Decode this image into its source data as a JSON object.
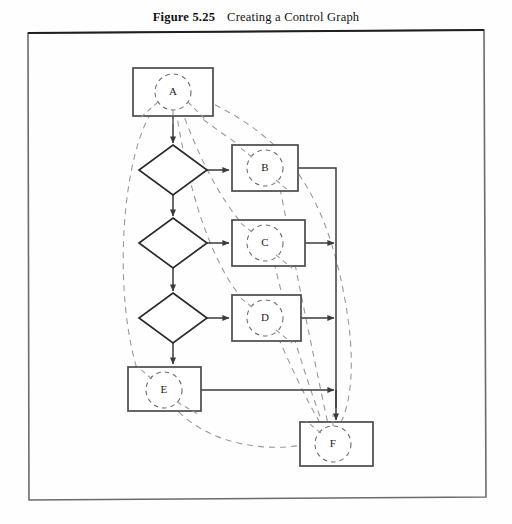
{
  "caption": {
    "figure_number": "Figure 5.25",
    "title": "Creating a Control Graph"
  },
  "colors": {
    "frame": "#6b6b6b",
    "solid_line": "#3a3a3a",
    "dashed_line": "#9a9a9a",
    "text": "#1a1a1a",
    "page_background": "#fefefe"
  },
  "figure": {
    "frame": {
      "x": 27,
      "y": 32,
      "width": 458,
      "height": 466
    },
    "process_nodes": [
      {
        "id": "A",
        "label": "A",
        "x": 133,
        "y": 68,
        "width": 80,
        "height": 48
      },
      {
        "id": "B",
        "label": "B",
        "x": 232,
        "y": 145,
        "width": 66,
        "height": 46
      },
      {
        "id": "C",
        "label": "C",
        "x": 232,
        "y": 220,
        "width": 73,
        "height": 46
      },
      {
        "id": "D",
        "label": "D",
        "x": 232,
        "y": 295,
        "width": 69,
        "height": 46
      },
      {
        "id": "E",
        "label": "E",
        "x": 128,
        "y": 367,
        "width": 73,
        "height": 44
      },
      {
        "id": "F",
        "label": "F",
        "x": 300,
        "y": 422,
        "width": 73,
        "height": 44
      }
    ],
    "decision_nodes": [
      {
        "id": "decision-1",
        "cx": 173,
        "cy": 170,
        "rx": 34,
        "ry": 25
      },
      {
        "id": "decision-2",
        "cx": 173,
        "cy": 243,
        "rx": 34,
        "ry": 25
      },
      {
        "id": "decision-3",
        "cx": 173,
        "cy": 318,
        "rx": 34,
        "ry": 25
      }
    ],
    "control_graph_circle_radius": 18,
    "trunk_line_x": 336,
    "flow_edges": [
      {
        "from": "A",
        "to": "decision-1"
      },
      {
        "from": "decision-1",
        "to": "B"
      },
      {
        "from": "decision-1",
        "to": "decision-2"
      },
      {
        "from": "decision-2",
        "to": "C"
      },
      {
        "from": "decision-2",
        "to": "decision-3"
      },
      {
        "from": "decision-3",
        "to": "D"
      },
      {
        "from": "decision-3",
        "to": "E"
      },
      {
        "from": "B",
        "to": "trunk"
      },
      {
        "from": "C",
        "to": "trunk"
      },
      {
        "from": "D",
        "to": "trunk"
      },
      {
        "from": "E",
        "to": "trunk"
      },
      {
        "from": "trunk",
        "to": "F"
      }
    ],
    "control_graph_edges": [
      {
        "from": "A",
        "to": "B"
      },
      {
        "from": "A",
        "to": "C"
      },
      {
        "from": "A",
        "to": "D"
      },
      {
        "from": "A",
        "to": "E"
      },
      {
        "from": "B",
        "to": "F"
      },
      {
        "from": "C",
        "to": "F"
      },
      {
        "from": "D",
        "to": "F"
      },
      {
        "from": "E",
        "to": "F"
      }
    ]
  }
}
